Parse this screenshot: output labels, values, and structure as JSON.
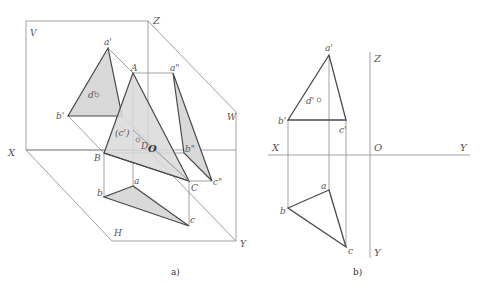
{
  "figure_a": {
    "caption": "a)",
    "planes": {
      "v": "V",
      "h": "H",
      "w": "W"
    },
    "axes": {
      "x": "X",
      "y": "Y",
      "z": "Z",
      "o": "O"
    },
    "points_space": {
      "A": "A",
      "B": "B",
      "C": "C",
      "D": "D"
    },
    "points_v": {
      "a": "a'",
      "b": "b'",
      "c": "(c')",
      "d": "d'"
    },
    "points_h": {
      "a": "a",
      "b": "b",
      "c": "c"
    },
    "points_w": {
      "a": "a\"",
      "b": "b\"",
      "c": "c\""
    }
  },
  "figure_b": {
    "caption": "b)",
    "axes": {
      "x": "X",
      "y_h": "Y",
      "y_w": "Y",
      "z": "Z",
      "o": "O"
    },
    "points_v": {
      "a": "a'",
      "b": "b'",
      "c": "c'",
      "d": "d'"
    },
    "points_h": {
      "a": "a",
      "b": "b",
      "c": "c"
    }
  },
  "colors": {
    "fill": "#d9d9d9",
    "line": "#4a4a4a",
    "thin": "#8a8a8a"
  }
}
